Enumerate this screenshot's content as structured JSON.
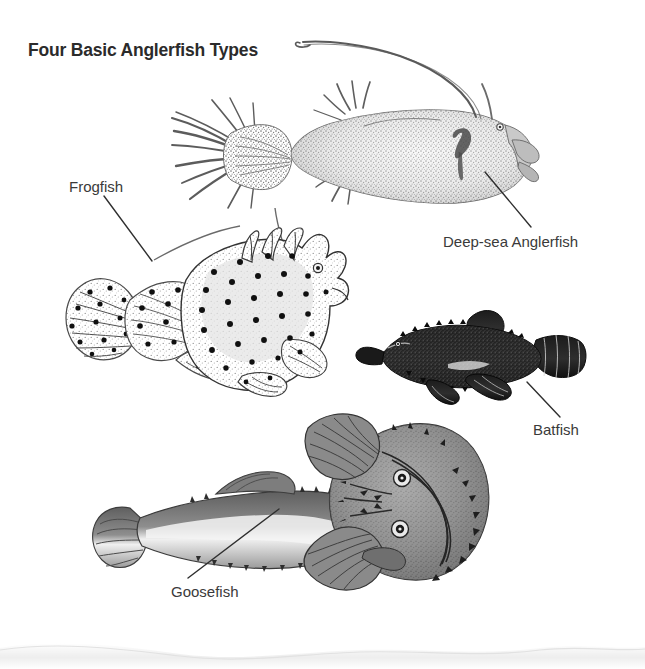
{
  "page": {
    "title": "Four Basic Anglerfish Types",
    "background_color": "#ffffff",
    "ink_color": "#2b2b2b",
    "label_color": "#3a3a3a",
    "page_edge_shadow_color": "#d8d8d8"
  },
  "labels": {
    "frogfish": "Frogfish",
    "deepsea": "Deep-sea Anglerfish",
    "batfish": "Batfish",
    "goosefish": "Goosefish"
  },
  "specimens": [
    {
      "name": "Deep-sea Anglerfish",
      "label": "Deep-sea Anglerfish",
      "orientation": "lateral view, facing right",
      "features": [
        "long illicium with esca lure arcing forward over head",
        "bulbous rounded body",
        "upturned mouth",
        "small eye",
        "fan of long caudal rays"
      ],
      "shading": "stipple, light to medium gray"
    },
    {
      "name": "Frogfish",
      "label": "Frogfish",
      "orientation": "lateral view, facing right",
      "features": [
        "dark round spots over body and fins",
        "three dorsal head spines",
        "rounded fan caudal fin",
        "limb-like pectoral fins",
        "thin illicium filament"
      ],
      "shading": "stipple with solid black ocelli"
    },
    {
      "name": "Batfish",
      "label": "Batfish",
      "orientation": "lateral view, facing left",
      "features": [
        "flattened warty body",
        "tubercled spiny margin",
        "short banded tail fin",
        "large arm-like pectoral fins"
      ],
      "shading": "dense dark stipple, near black"
    },
    {
      "name": "Goosefish",
      "label": "Goosefish",
      "orientation": "dorsal view, head at right",
      "features": [
        "very wide flattened head",
        "two dorsally placed eyes",
        "wide toothed mouth rim",
        "spiny fringe around head margin",
        "tapering tail with fan caudal fin",
        "large fan pectoral fins"
      ],
      "shading": "tonal wash with fine hatching"
    }
  ],
  "callout_lines": [
    {
      "name": "frogfish",
      "from": [
        104,
        196
      ],
      "to": [
        152,
        261
      ]
    },
    {
      "name": "deepsea",
      "from": [
        531,
        227
      ],
      "to": [
        485,
        172
      ]
    },
    {
      "name": "batfish",
      "from": [
        560,
        417
      ],
      "to": [
        527,
        382
      ]
    },
    {
      "name": "goosefish",
      "from": [
        188,
        578
      ],
      "to": [
        279,
        509
      ]
    }
  ]
}
